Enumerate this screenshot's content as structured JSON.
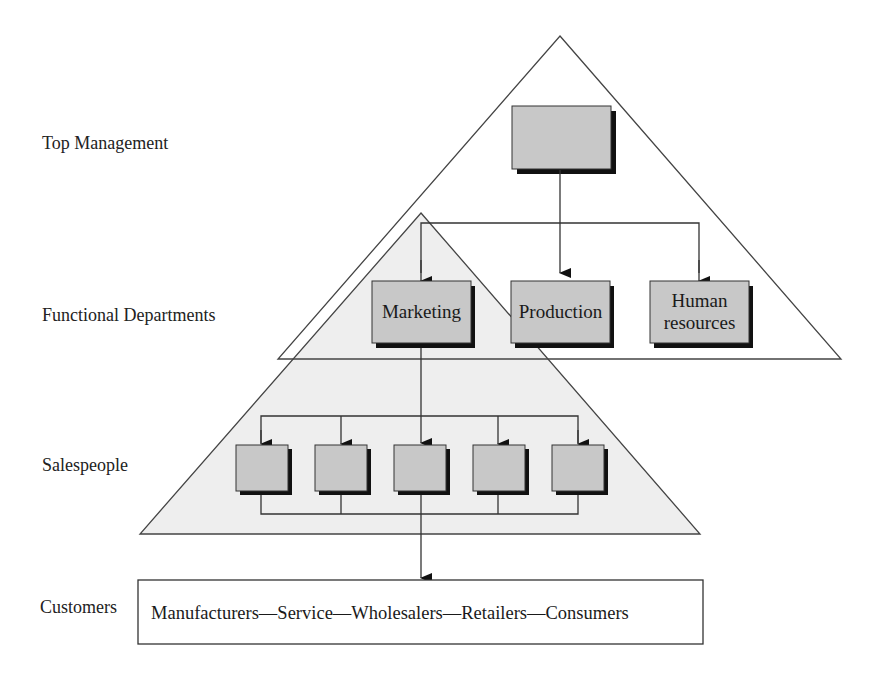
{
  "levels": {
    "top_management": "Top Management",
    "functional_departments": "Functional Departments",
    "salespeople": "Salespeople",
    "customers": "Customers"
  },
  "departments": [
    {
      "label": "Marketing"
    },
    {
      "label": "Production"
    },
    {
      "label": "Human\nresources"
    }
  ],
  "salespeople_boxes": 5,
  "customers_box": {
    "text": "Manufacturers—Service—Wholesalers—Retailers—Consumers"
  },
  "colors": {
    "box_fill": "#c8c8c8",
    "box_shadow": "#111111",
    "triangle_fill": "#eeeeee",
    "line": "#333333"
  }
}
